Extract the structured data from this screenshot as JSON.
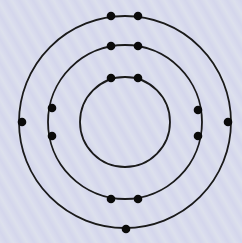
{
  "diagram": {
    "type": "bohr-model",
    "nucleus_center": [
      125,
      122
    ],
    "shell_color": "#1a1a1a",
    "electron_color": "#0a0a0a",
    "shells": [
      {
        "name": "shell-1",
        "radius": 45,
        "electron_count": 2,
        "electrons": [
          [
            111,
            78
          ],
          [
            138,
            78
          ]
        ]
      },
      {
        "name": "shell-2",
        "radius": 77,
        "electron_count": 8,
        "electrons": [
          [
            111,
            46
          ],
          [
            138,
            46
          ],
          [
            52,
            108
          ],
          [
            52,
            136
          ],
          [
            198,
            110
          ],
          [
            198,
            136
          ],
          [
            111,
            199
          ],
          [
            138,
            199
          ]
        ]
      },
      {
        "name": "shell-3",
        "radius": 106,
        "electron_count": 5,
        "electrons": [
          [
            111,
            16
          ],
          [
            138,
            16
          ],
          [
            22,
            122
          ],
          [
            228,
            122
          ],
          [
            126,
            229
          ]
        ]
      }
    ],
    "total_electrons": 15
  }
}
